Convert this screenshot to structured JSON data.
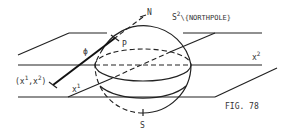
{
  "figure": {
    "caption": "FIG. 78",
    "labels": {
      "north": "N",
      "south": "S",
      "sphere_base": "S",
      "sphere_sup": "2",
      "sphere_rest": "\\{NORTHPOLE}",
      "point_p": "P",
      "map_phi": "ϕ",
      "coord_open": "(x",
      "coord_sup1": "1",
      "coord_mid": ",x",
      "coord_sup2": "2",
      "coord_close": ")",
      "axis1_base": "x",
      "axis1_sup": "1",
      "axis2_base": "x",
      "axis2_sup": "2"
    },
    "colors": {
      "ink": "#222222",
      "background": "#ffffff"
    }
  }
}
